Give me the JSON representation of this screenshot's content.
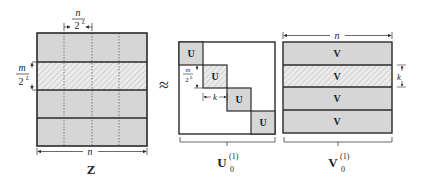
{
  "diagram": {
    "z_matrix": {
      "name": "Z",
      "rows": 4,
      "cols": 4,
      "hatched_row_index": 1,
      "top_label": {
        "num": "n",
        "den": "2",
        "exp": "L"
      },
      "left_label": {
        "num": "m",
        "den": "2",
        "exp": "L"
      },
      "bottom_label": "n"
    },
    "approx_symbol": "≈",
    "u_matrix": {
      "block_label": "U",
      "blocks": 4,
      "hatched_block_index": 1,
      "left_label": {
        "num": "m",
        "den": "2",
        "exp": "L"
      },
      "width_label": "k",
      "name_base": "U",
      "name_sub": "0",
      "name_sup": "(1)"
    },
    "v_matrix": {
      "block_label": "V",
      "blocks": 4,
      "hatched_block_index": 1,
      "top_label": "n",
      "right_label": "k",
      "name_base": "V",
      "name_sub": "0",
      "name_sup": "(1)"
    },
    "colors": {
      "fill": "#d6d6d6",
      "hatch_bg": "#ebebeb",
      "hatch_line": "#b5b5b5",
      "stroke": "#2a2a2a"
    }
  }
}
